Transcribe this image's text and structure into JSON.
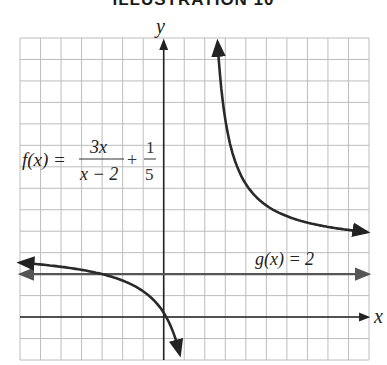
{
  "title": "ILLUSTRATION 10",
  "chart_data": {
    "type": "line",
    "title": "ILLUSTRATION 10",
    "xlabel": "x",
    "ylabel": "y",
    "grid": true,
    "xlim": [
      -7,
      10
    ],
    "ylim": [
      -2,
      13
    ],
    "grid_step": 1,
    "series": [
      {
        "name": "f(x) = 3x/(x − 2) + 1/5",
        "expression": "3x/(x-2) + 1/5",
        "vertical_asymptote": 2,
        "horizontal_asymptote": 3.2,
        "branches": [
          {
            "x": [
              -7,
              -6,
              -5,
              -4,
              -3,
              -2,
              -1,
              0,
              0.5,
              0.75
            ],
            "y": [
              2.53,
              2.45,
              2.34,
              2.2,
              2.0,
              1.7,
              1.2,
              0.2,
              -0.8,
              -1.6
            ]
          },
          {
            "x": [
              2.2,
              2.3,
              2.5,
              3,
              3.5,
              4,
              5,
              6,
              7,
              8,
              9,
              10
            ],
            "y": [
              33.2,
              23.2,
              15.2,
              9.2,
              7.2,
              6.2,
              5.2,
              4.7,
              4.4,
              4.2,
              4.06,
              3.95
            ]
          }
        ]
      },
      {
        "name": "g(x) = 2",
        "expression": "2",
        "x": [
          -7,
          10
        ],
        "y": [
          2,
          2
        ]
      }
    ],
    "annotations": [
      {
        "text": "f(x) = 3x/(x − 2) + 1/5",
        "position": "upper-left"
      },
      {
        "text": "g(x) = 2",
        "position": "above horizontal line, right"
      }
    ]
  },
  "labels": {
    "y_axis": "y",
    "x_axis": "x",
    "f_prefix": "f(x) =",
    "f_num": "3x",
    "f_den": "x − 2",
    "plus": "+",
    "c_num": "1",
    "c_den": "5",
    "g_label": "g(x) = 2"
  }
}
